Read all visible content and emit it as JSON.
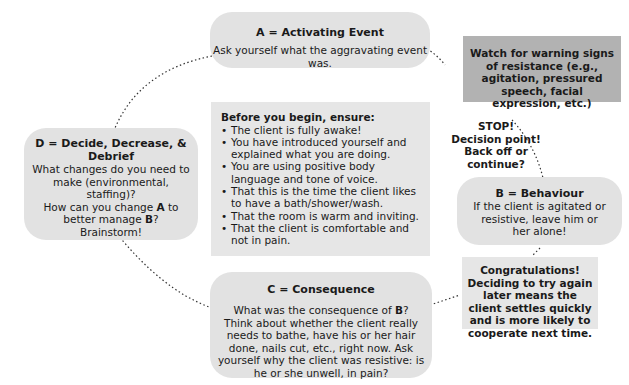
{
  "a_box": {
    "title": "A = Activating Event",
    "text": "Ask yourself what the aggravating event was."
  },
  "warning_box": {
    "text": "Watch for warning signs of resistance (e.g., agitation, pressured speech, facial expression, etc.)"
  },
  "stop_note": {
    "line1": "STOP!",
    "line2": "Decision point!",
    "line3": "Back off or",
    "line4": "continue?"
  },
  "b_box": {
    "title": "B = Behaviour",
    "text": "If the client is agitated or resistive, leave him or her alone!"
  },
  "congrats_box": {
    "line1": "Congratulations!",
    "line2": "Deciding to try again later means the client settles quickly and is more likely to cooperate next time."
  },
  "c_box": {
    "title": "C = Consequence",
    "text_pre": "What was the consequence of ",
    "text_bold": "B",
    "text_post": "?",
    "text2": "Think about whether the client really needs to bathe, have his or her hair done, nails cut, etc., right now. Ask yourself why the client was resistive: is he or she unwell, in pain?"
  },
  "d_box": {
    "title": "D = Decide, Decrease, & Debrief",
    "text1": "What changes do you need to make (environmental, staffing)?",
    "text2_pre": "How can you change ",
    "text2_a": "A",
    "text2_mid": " to better manage ",
    "text2_b": "B",
    "text2_post": "?",
    "text3": "Brainstorm!"
  },
  "checklist": {
    "heading": "Before you begin, ensure:",
    "items": [
      "The client is fully awake!",
      "You have introduced yourself and explained what you are doing.",
      "You are using positive body language and tone of voice.",
      "That this is the time the client likes to have a bath/shower/wash.",
      "That the room is warm and inviting.",
      "That the client is comfortable and not in pain."
    ]
  },
  "colors": {
    "rounded_box": "#e2e2e2",
    "flat_box": "#e6e6e6",
    "warning_box": "#b2b2b2",
    "text": "#1a1a1a",
    "connector": "#333333"
  }
}
